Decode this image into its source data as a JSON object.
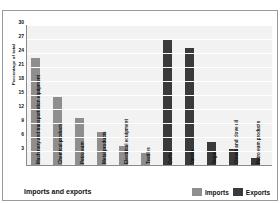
{
  "chart_data": {
    "type": "bar",
    "title": "Imports and exports",
    "xlabel": "",
    "ylabel": "Percentage of total",
    "ylim": [
      0,
      30
    ],
    "ytick_labels": [
      "30",
      "27",
      "24",
      "21",
      "18",
      "15",
      "12",
      "9",
      "6",
      "3"
    ],
    "ytick_values": [
      30,
      27,
      24,
      21,
      18,
      15,
      12,
      9,
      6,
      3
    ],
    "grid": true,
    "legend_position": "bottom-right",
    "categories": [
      "Machinery and transportation equipment",
      "Chemical products",
      "Petroleum",
      "Metal products",
      "Electrical equipment",
      "Textiles",
      "Coffee",
      "Vanilla",
      "Sugar",
      "Cloves and clove oil",
      "Petroleum products"
    ],
    "series": [
      {
        "name": "Imports",
        "color": "#8e8e8e",
        "values": [
          23,
          14.5,
          10,
          7,
          4,
          2.5,
          null,
          null,
          null,
          null,
          null
        ]
      },
      {
        "name": "Exports",
        "color": "#3a3a3a",
        "values": [
          null,
          null,
          null,
          null,
          null,
          null,
          27,
          25,
          5,
          3.5,
          1.5
        ]
      }
    ],
    "bars": [
      {
        "category": "Machinery and transportation equipment",
        "series": "Imports",
        "value": 23
      },
      {
        "category": "Chemical products",
        "series": "Imports",
        "value": 14.5
      },
      {
        "category": "Petroleum",
        "series": "Imports",
        "value": 10
      },
      {
        "category": "Metal products",
        "series": "Imports",
        "value": 7
      },
      {
        "category": "Electrical equipment",
        "series": "Imports",
        "value": 4
      },
      {
        "category": "Textiles",
        "series": "Imports",
        "value": 2.5
      },
      {
        "category": "Coffee",
        "series": "Exports",
        "value": 27
      },
      {
        "category": "Vanilla",
        "series": "Exports",
        "value": 25
      },
      {
        "category": "Sugar",
        "series": "Exports",
        "value": 5
      },
      {
        "category": "Cloves and clove oil",
        "series": "Exports",
        "value": 3.5
      },
      {
        "category": "Petroleum products",
        "series": "Exports",
        "value": 1.5
      }
    ]
  },
  "legend": {
    "imports_label": "Imports",
    "exports_label": "Exports"
  },
  "colors": {
    "imports": "#8e8e8e",
    "exports": "#3a3a3a",
    "plot_background": "#f2f2f2",
    "gridline": "#ffffff"
  }
}
